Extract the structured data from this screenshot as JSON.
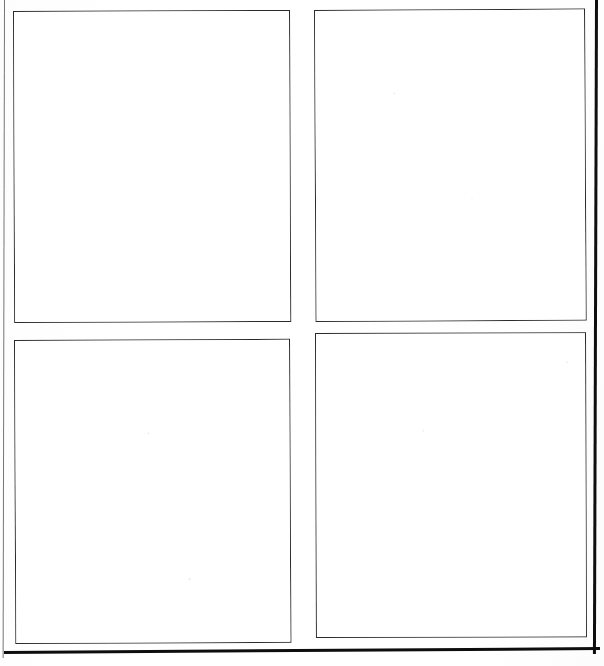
{
  "page": {
    "width": 604,
    "height": 666,
    "background_color": "#ffffff",
    "line_color": "#2a2a2a",
    "edge_color": "#0d0d0d",
    "content_text": ""
  },
  "page_edges": [
    {
      "name": "left",
      "label": "",
      "color": "#5d5d5d",
      "thickness": "1.4px"
    },
    {
      "name": "right",
      "label": "",
      "color": "#0e0e0e",
      "thickness": "3.2px"
    },
    {
      "name": "bottom",
      "label": "",
      "color": "#0d0d0d",
      "thickness": "3.4px"
    }
  ],
  "grid": {
    "rows": 2,
    "columns": 2,
    "panel_count": 4,
    "panels": [
      {
        "position": "top-left",
        "label": "",
        "content": "",
        "border_color": "#2a2a2a",
        "fill_color": "#ffffff"
      },
      {
        "position": "top-right",
        "label": "",
        "content": "",
        "border_color": "#2a2a2a",
        "fill_color": "#ffffff"
      },
      {
        "position": "bottom-left",
        "label": "",
        "content": "",
        "border_color": "#2a2a2a",
        "fill_color": "#ffffff"
      },
      {
        "position": "bottom-right",
        "label": "",
        "content": "",
        "border_color": "#2a2a2a",
        "fill_color": "#ffffff"
      }
    ]
  }
}
